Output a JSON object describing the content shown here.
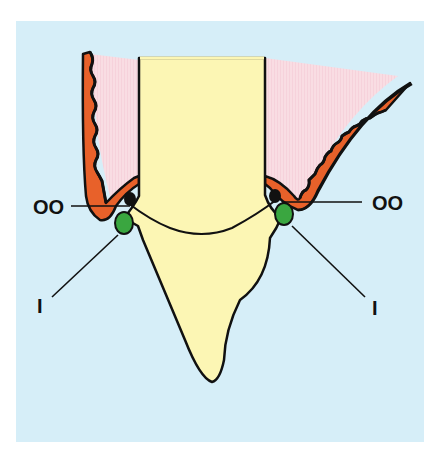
{
  "diagram": {
    "type": "dental cross-section",
    "colors": {
      "background": "#d6eef8",
      "page": "#ffffff",
      "tooth": "#fcf6b4",
      "gingiva_fill": "#f9dde3",
      "epithelium": "#e8612a",
      "outline": "#111111",
      "green_structure": "#3aa640",
      "black_structure": "#111111"
    },
    "labels": {
      "left_upper": "OO",
      "right_upper": "OO",
      "left_lower": "I",
      "right_lower": "I"
    }
  }
}
